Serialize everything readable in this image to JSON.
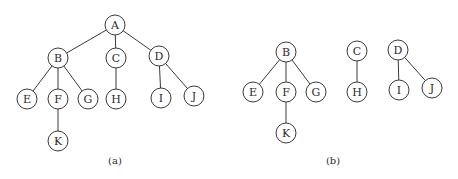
{
  "diagram": {
    "node_radius": 10,
    "stroke_color": "#3a3a3a",
    "panels": [
      {
        "caption": "(a)",
        "caption_pos": [
          115,
          160
        ],
        "nodes": [
          {
            "id": "A",
            "x": 115,
            "y": 25
          },
          {
            "id": "B",
            "x": 58,
            "y": 58
          },
          {
            "id": "C",
            "x": 116,
            "y": 58
          },
          {
            "id": "D",
            "x": 159,
            "y": 56
          },
          {
            "id": "E",
            "x": 27,
            "y": 99
          },
          {
            "id": "F",
            "x": 58,
            "y": 99
          },
          {
            "id": "G",
            "x": 88,
            "y": 99
          },
          {
            "id": "H",
            "x": 116,
            "y": 99
          },
          {
            "id": "I",
            "x": 161,
            "y": 98
          },
          {
            "id": "J",
            "x": 194,
            "y": 96
          },
          {
            "id": "K",
            "x": 58,
            "y": 141
          }
        ],
        "edges": [
          [
            "A",
            "B"
          ],
          [
            "A",
            "C"
          ],
          [
            "A",
            "D"
          ],
          [
            "B",
            "E"
          ],
          [
            "B",
            "F"
          ],
          [
            "B",
            "G"
          ],
          [
            "C",
            "H"
          ],
          [
            "D",
            "I"
          ],
          [
            "D",
            "J"
          ],
          [
            "F",
            "K"
          ]
        ]
      },
      {
        "caption": "(b)",
        "caption_pos": [
          333,
          160
        ],
        "nodes": [
          {
            "id": "B",
            "x": 286,
            "y": 52
          },
          {
            "id": "E",
            "x": 253,
            "y": 92
          },
          {
            "id": "F",
            "x": 286,
            "y": 92
          },
          {
            "id": "G",
            "x": 316,
            "y": 92
          },
          {
            "id": "K",
            "x": 286,
            "y": 133
          },
          {
            "id": "C",
            "x": 357,
            "y": 51
          },
          {
            "id": "H",
            "x": 357,
            "y": 92
          },
          {
            "id": "D",
            "x": 398,
            "y": 50
          },
          {
            "id": "I",
            "x": 399,
            "y": 90
          },
          {
            "id": "J",
            "x": 432,
            "y": 88
          }
        ],
        "edges": [
          [
            "B",
            "E"
          ],
          [
            "B",
            "F"
          ],
          [
            "B",
            "G"
          ],
          [
            "F",
            "K"
          ],
          [
            "C",
            "H"
          ],
          [
            "D",
            "I"
          ],
          [
            "D",
            "J"
          ]
        ]
      }
    ]
  }
}
